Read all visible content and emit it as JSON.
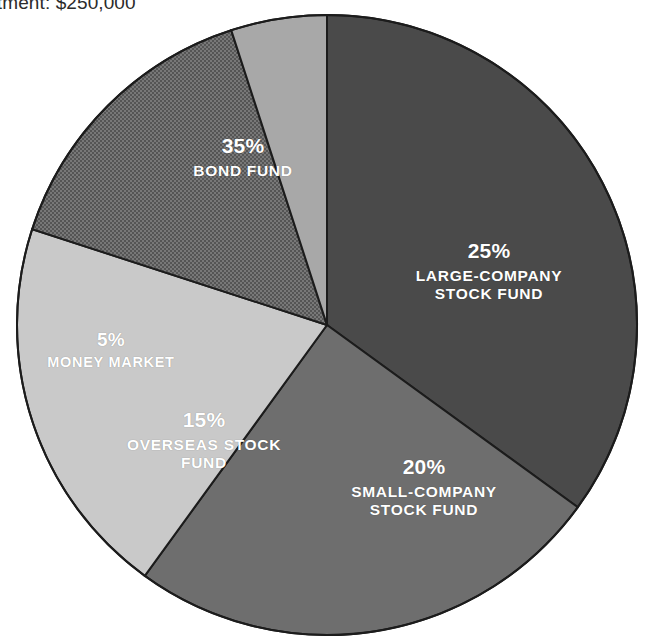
{
  "title": "Total investment: $250,000",
  "title_visible_fragment": "ment: $250,000",
  "chart_data": {
    "type": "pie",
    "title": "Total investment: $250,000",
    "xlabel": "",
    "ylabel": "",
    "legend_position": "none",
    "labels_inside_slices": true,
    "start_angle_deg": 0,
    "direction": "clockwise",
    "categories": [
      "BOND FUND",
      "LARGE-COMPANY STOCK FUND",
      "SMALL-COMPANY STOCK FUND",
      "OVERSEAS STOCK FUND",
      "MONEY MARKET"
    ],
    "values": [
      35,
      25,
      20,
      15,
      5
    ],
    "value_suffix": "%",
    "colors": [
      "#4a4a4a",
      "#6e6e6e",
      "#c9c9c9",
      "#6a6a6a",
      "#a8a8a8"
    ],
    "slices": [
      {
        "name": "BOND FUND",
        "value": 35,
        "percent_label": "35%",
        "name_lines": [
          "BOND FUND"
        ],
        "color": "#4a4a4a",
        "texture": "solid"
      },
      {
        "name": "LARGE-COMPANY STOCK FUND",
        "value": 25,
        "percent_label": "25%",
        "name_lines": [
          "LARGE-COMPANY",
          "STOCK FUND"
        ],
        "color": "#6e6e6e",
        "texture": "solid"
      },
      {
        "name": "SMALL-COMPANY STOCK FUND",
        "value": 20,
        "percent_label": "20%",
        "name_lines": [
          "SMALL-COMPANY",
          "STOCK FUND"
        ],
        "color": "#c9c9c9",
        "texture": "solid"
      },
      {
        "name": "OVERSEAS STOCK FUND",
        "value": 15,
        "percent_label": "15%",
        "name_lines": [
          "OVERSEAS STOCK",
          "FUND"
        ],
        "color": "#6a6a6a",
        "texture": "dither"
      },
      {
        "name": "MONEY MARKET",
        "value": 5,
        "percent_label": "5%",
        "name_lines": [
          "MONEY MARKET"
        ],
        "color": "#a8a8a8",
        "texture": "solid"
      }
    ]
  },
  "colors": {
    "background": "#ffffff",
    "outline": "#1c1c1c",
    "label_text": "#ffffff",
    "title_text": "#2b2b2b"
  }
}
